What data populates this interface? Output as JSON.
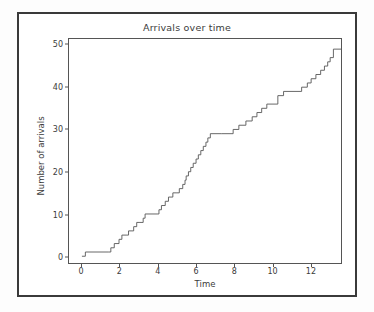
{
  "chart_data": {
    "type": "line",
    "title": "Arrivals over time",
    "xlabel": "Time",
    "ylabel": "Number of arrivals",
    "drawstyle": "steps-post",
    "grid": false,
    "legend": null,
    "line_color": "#555555",
    "xlim": [
      -0.68,
      13.62
    ],
    "ylim": [
      -1.6,
      51.4
    ],
    "xticks": [
      0,
      2,
      4,
      6,
      8,
      10,
      12
    ],
    "yticks": [
      0,
      10,
      20,
      30,
      40,
      50
    ],
    "xtick_labels": [
      "0",
      "2",
      "4",
      "6",
      "8",
      "10",
      "12"
    ],
    "ytick_labels": [
      "0",
      "10",
      "20",
      "30",
      "40",
      "50"
    ],
    "x": [
      0.0,
      0.18,
      1.38,
      1.52,
      1.7,
      1.95,
      2.1,
      2.32,
      2.45,
      2.72,
      2.88,
      3.05,
      3.22,
      3.32,
      3.95,
      4.05,
      4.18,
      4.38,
      4.55,
      4.78,
      4.95,
      5.12,
      5.3,
      5.42,
      5.48,
      5.6,
      5.72,
      5.85,
      6.0,
      6.12,
      6.25,
      6.38,
      6.52,
      6.62,
      6.75,
      7.35,
      7.95,
      8.25,
      8.62,
      8.95,
      9.2,
      9.45,
      9.72,
      10.3,
      10.6,
      11.55,
      11.85,
      12.05,
      12.3,
      12.55,
      12.75,
      12.92,
      13.05,
      13.22
    ],
    "y": [
      0,
      1,
      1,
      2,
      3,
      4,
      5,
      5,
      6,
      7,
      8,
      8,
      9,
      10,
      10,
      11,
      12,
      13,
      14,
      15,
      15,
      16,
      17,
      18,
      19,
      20,
      21,
      22,
      23,
      24,
      25,
      26,
      27,
      28,
      29,
      29,
      30,
      31,
      32,
      33,
      34,
      35,
      36,
      38,
      39,
      40,
      41,
      42,
      43,
      44,
      45,
      46,
      47,
      49
    ],
    "series": [
      {
        "name": "arrivals",
        "description": "Cumulative counting process of arrival events; step function increasing by one unit at each arrival time.",
        "n_arrivals": 49,
        "t_max": 13.22,
        "y_max": 49
      }
    ]
  },
  "figure": {
    "background": "#ffffff",
    "frame_color": "#3a3a3a",
    "axes_color": "#555555",
    "text_color": "#3b3b3b"
  }
}
